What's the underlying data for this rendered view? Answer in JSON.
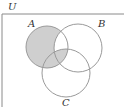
{
  "diagram": {
    "type": "venn",
    "universe_label": "U",
    "sets": [
      {
        "label": "A",
        "cx": 47,
        "cy": 47,
        "r": 21
      },
      {
        "label": "B",
        "cx": 78,
        "cy": 48,
        "r": 24
      },
      {
        "label": "C",
        "cx": 66,
        "cy": 73,
        "r": 24
      }
    ],
    "shaded_regions": [
      "A only",
      "A∩C (not B)",
      "A∩B∩C"
    ],
    "unshaded_regions": [
      "A∩B (not C)",
      "B only",
      "C only",
      "B∩C (not A)"
    ],
    "colors": {
      "shade": "#cfcfcf",
      "stroke": "#9a9a9a",
      "frame": "#8a8a8a"
    }
  }
}
